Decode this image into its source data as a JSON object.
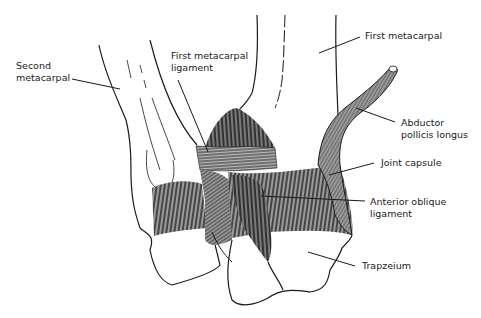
{
  "diagram": {
    "type": "anatomical illustration",
    "labels": [
      {
        "id": "second-metacarpal",
        "text": "Second\nmetacarpal",
        "x": 16,
        "y": 60
      },
      {
        "id": "first-metacarpal-ligament",
        "text": "First metacarpal\nligament",
        "x": 171,
        "y": 50
      },
      {
        "id": "first-metacarpal",
        "text": "First metacarpal",
        "x": 365,
        "y": 30
      },
      {
        "id": "abductor-pollicis-longus",
        "text": "Abductor\npollicis longus",
        "x": 401,
        "y": 117
      },
      {
        "id": "joint-capsule",
        "text": "Joint capsule",
        "x": 381,
        "y": 155
      },
      {
        "id": "anterior-oblique-ligament",
        "text": "Anterior oblique\nligament",
        "x": 370,
        "y": 197
      },
      {
        "id": "trapzeium",
        "text": "Trapzeium",
        "x": 362,
        "y": 259
      }
    ],
    "colors": {
      "line": "#1a1a1a",
      "fill_dark": "#4a4a4a",
      "fill_mid": "#8a8a8a",
      "background": "#ffffff"
    }
  }
}
